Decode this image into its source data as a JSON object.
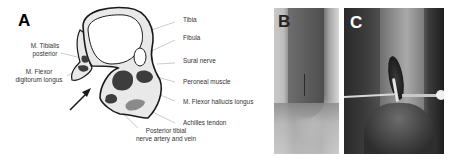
{
  "panels": {
    "a": {
      "letter": "A",
      "labels": {
        "tibia": "Tibia",
        "fibula": "Fibula",
        "sural_nerve": "Sural nerve",
        "peroneal_muscle": "Peroneal muscle",
        "flexor_hallucis": "M. Flexor hallucis longus",
        "achilles": "Achilles tendon",
        "tibialis_posterior_1": "M. Tibialis",
        "tibialis_posterior_2": "posterior",
        "flexor_digitorum_1": "M. Flexor",
        "flexor_digitorum_2": "digitorum longus",
        "posterior_tibial_1": "Posterior tibial",
        "posterior_tibial_2": "nerve artery and vein"
      }
    },
    "b": {
      "letter": "B"
    },
    "c": {
      "letter": "C"
    }
  },
  "colors": {
    "outline": "#1a1a1a",
    "tissue_fill": "#e9e9e9",
    "bone_fill": "#ffffff",
    "muscle_fill": "#3d3d3d",
    "tendon_fill": "#8a8a8a",
    "leader_line": "#aaaaaa"
  }
}
